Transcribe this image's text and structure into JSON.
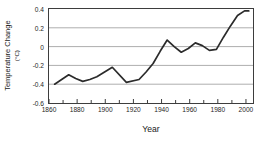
{
  "chart_data": {
    "type": "line",
    "title": "",
    "xlabel": "Year",
    "ylabel": "Temperature Change",
    "ylabel_unit": "(°C)",
    "xlim": [
      1860,
      2005
    ],
    "ylim": [
      -0.6,
      0.4
    ],
    "grid": true,
    "legend": "none",
    "xticks": [
      1860,
      1880,
      1900,
      1920,
      1940,
      1960,
      1980,
      2000
    ],
    "xticklabels": [
      "1860",
      "1880",
      "1900",
      "1920",
      "1940",
      "1960",
      "1980",
      "2000"
    ],
    "xminor_step": 10,
    "yticks": [
      0.4,
      0.2,
      0,
      -0.2,
      -0.4,
      -0.6
    ],
    "yticklabels": [
      "0.4",
      "0.2",
      "0",
      "-0.2",
      "-0.4",
      "-0.6"
    ],
    "series": [
      {
        "name": "Global temperature anomaly",
        "color": "#2b2b2b",
        "x": [
          1864,
          1874,
          1879,
          1884,
          1889,
          1894,
          1905,
          1915,
          1924,
          1929,
          1934,
          1939,
          1944,
          1949,
          1954,
          1959,
          1964,
          1969,
          1974,
          1979,
          1984,
          1989,
          1994,
          1999,
          2002
        ],
        "y": [
          -0.4,
          -0.3,
          -0.34,
          -0.37,
          -0.35,
          -0.32,
          -0.22,
          -0.38,
          -0.35,
          -0.27,
          -0.18,
          -0.05,
          0.07,
          0.0,
          -0.06,
          -0.02,
          0.04,
          0.01,
          -0.04,
          -0.03,
          0.1,
          0.22,
          0.33,
          0.38,
          0.38
        ]
      }
    ]
  },
  "axis_colors": {
    "frame": "#3d3d3d",
    "gridline": "#aeaeae",
    "tick": "#3d3d3d",
    "text": "#1a1a1a",
    "background": "#ffffff"
  }
}
